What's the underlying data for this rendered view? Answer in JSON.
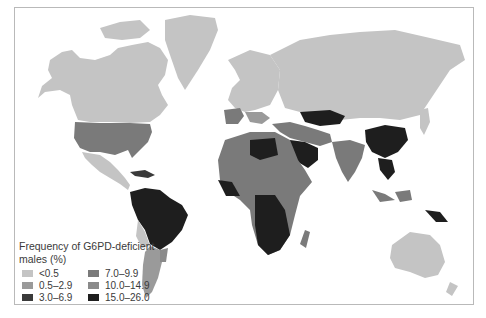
{
  "legend": {
    "title_line1": "Frequency of G6PD-deficient",
    "title_line2": "males (%)",
    "items": [
      {
        "label": "<0.5",
        "color": "#c4c4c4"
      },
      {
        "label": "0.5–2.9",
        "color": "#9a9a9a"
      },
      {
        "label": "3.0–6.9",
        "color": "#3a3a3a"
      },
      {
        "label": "7.0–9.9",
        "color": "#7a7a7a"
      },
      {
        "label": "10.0–14.9",
        "color": "#8a8a8a"
      },
      {
        "label": "15.0–26.0",
        "color": "#1e1e1e"
      }
    ]
  },
  "map": {
    "subject": "World map of G6PD deficiency frequency in males",
    "regions": [
      {
        "name": "North America (Canada, Alaska, Greenland)",
        "class": "<0.5"
      },
      {
        "name": "United States",
        "class": "7.0–9.9"
      },
      {
        "name": "Mexico",
        "class": "<0.5"
      },
      {
        "name": "Brazil / Colombia / Venezuela",
        "class": "15.0–26.0"
      },
      {
        "name": "Argentina / Chile",
        "class": "0.5–2.9"
      },
      {
        "name": "Europe",
        "class": "<0.5"
      },
      {
        "name": "Russia / Northern Asia",
        "class": "<0.5"
      },
      {
        "name": "Saudi Arabia",
        "class": "15.0–26.0"
      },
      {
        "name": "Central/Southern Africa",
        "class": "15.0–26.0"
      },
      {
        "name": "North Africa",
        "class": "7.0–9.9"
      },
      {
        "name": "India",
        "class": "7.0–9.9"
      },
      {
        "name": "Southern China / SE Asia",
        "class": "15.0–26.0"
      },
      {
        "name": "Australia",
        "class": "<0.5"
      },
      {
        "name": "Papua New Guinea",
        "class": "15.0–26.0"
      }
    ]
  }
}
